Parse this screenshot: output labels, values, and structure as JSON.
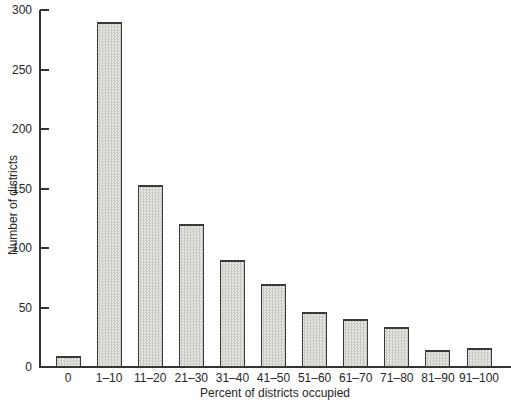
{
  "figure": {
    "background": "#ffffff",
    "ink_color": "#333331",
    "text_color": "#262626",
    "bar_fill_light": "#ebe9e6",
    "bar_fill_dot": "#c9c8c5",
    "bar_border": "#3a3a38"
  },
  "chart_data": {
    "type": "bar",
    "title": "",
    "categories": [
      "0",
      "1–10",
      "11–20",
      "21–30",
      "31–40",
      "41–50",
      "51–60",
      "61–70",
      "71–80",
      "81–90",
      "91–100"
    ],
    "values": [
      9,
      290,
      153,
      120,
      90,
      70,
      46,
      40,
      34,
      14,
      16
    ],
    "xlabel": "Percent of districts occupied",
    "ylabel": "Number of districts",
    "ylim": [
      0,
      300
    ],
    "yticks": [
      0,
      50,
      100,
      150,
      200,
      250,
      300
    ],
    "grid": false,
    "legend": null,
    "bar_style": "stippled-gray-with-dark-outline"
  }
}
